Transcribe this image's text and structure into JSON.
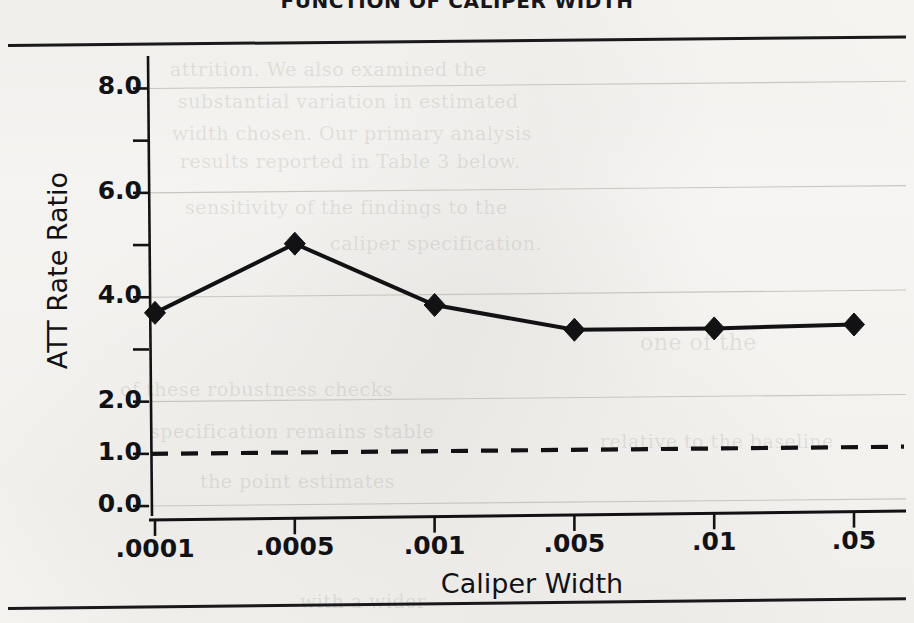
{
  "chart_data": {
    "type": "line",
    "title": "FUNCTION OF CALIPER WIDTH",
    "xlabel": "Caliper Width",
    "ylabel": "ATT Rate Ratio",
    "categories": [
      ".0001",
      ".0005",
      ".001",
      ".005",
      ".01",
      ".05"
    ],
    "values": [
      3.7,
      5.0,
      3.8,
      3.3,
      3.3,
      3.35
    ],
    "series": [
      {
        "name": "ATT Rate Ratio",
        "values": [
          3.7,
          5.0,
          3.8,
          3.3,
          3.3,
          3.35
        ],
        "marker": "diamond",
        "color": "#121215"
      }
    ],
    "ylim": [
      0.0,
      8.4
    ],
    "y_ticks_labeled": [
      "0.0",
      "1.0",
      "2.0",
      "4.0",
      "6.0",
      "8.0"
    ],
    "y_tick_values_labeled": [
      0.0,
      1.0,
      2.0,
      4.0,
      6.0,
      8.0
    ],
    "y_ticks_unlabeled": [
      3.0,
      5.0,
      7.0
    ],
    "gridlines": [
      2.0,
      4.0,
      6.0,
      8.0
    ],
    "grid": true,
    "legend": "none",
    "reference_line": {
      "value": 1.0,
      "style": "dashed",
      "label": "1.0",
      "color": "#121215"
    }
  },
  "axes": {
    "y_labels": [
      "8.0",
      "6.0",
      "4.0",
      "2.0",
      "1.0",
      "0.0"
    ],
    "x_labels": [
      ".0001",
      ".0005",
      ".001",
      ".005",
      ".01",
      ".05"
    ],
    "y_title": "ATT Rate Ratio",
    "x_title": "Caliper Width"
  },
  "page": {
    "title_text": "FUNCTION OF CALIPER WIDTH",
    "background_color": "#fbfaf8",
    "ink_color": "#121215",
    "grid_color": "#c9c6c0"
  },
  "ghost_text": [
    "attrition. We also examined the",
    "substantial variation in estimated",
    "width chosen. Our primary analysis",
    "results reported in Table 3 below.",
    "sensitivity of the findings to the",
    "caliper specification.",
    "one of the",
    "of these robustness checks",
    "specification remains stable",
    "relative to the baseline",
    "the point estimates",
    "with a wider"
  ]
}
